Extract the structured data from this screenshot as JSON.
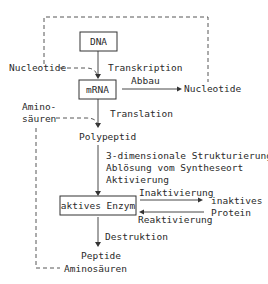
{
  "diagram": {
    "type": "flowchart",
    "nodes": {
      "dna": "DNA",
      "mrna": "mRNA",
      "nucleotide_in": "Nucleotide",
      "nucleotide_out": "Nucleotide",
      "amino_in_1": "Amino-",
      "amino_in_2": "säuren",
      "polypeptid": "Polypeptid",
      "aktives_enzym": "aktives Enzym",
      "inaktives_1": "inaktives",
      "inaktives_2": "Protein",
      "peptide": "Peptide",
      "aminosaeuren_out": "Aminosäuren"
    },
    "edges": {
      "transkription": "Transkription",
      "abbau": "Abbau",
      "translation": "Translation",
      "step1": "3-dimensionale Strukturierung",
      "step2": "Ablösung vom Syntheseort",
      "step3": "Aktivierung",
      "inaktivierung": "Inaktivierung",
      "reaktivierung": "Reaktivierung",
      "destruktion": "Destruktion"
    },
    "colors": {
      "line": "#333333",
      "text": "#2a2a2a",
      "background": "#ffffff"
    }
  }
}
